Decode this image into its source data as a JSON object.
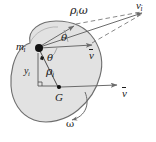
{
  "figure": {
    "kind": "rigid-body-velocity-diagram",
    "background_color": "#ffffff",
    "body_fill_color": "#e2e2e2",
    "body_stroke_color": "#6e6e6e",
    "line_color": "#6b6b6b",
    "text_color": "#1b1b1b",
    "point_color": "#111111",
    "labels": {
      "mass_element": "m",
      "mass_element_sub": "i",
      "center_of_mass": "G",
      "rho": "ρ",
      "rho_sub": "i",
      "rho_omega": "ρ",
      "rho_omega_sub": "i",
      "rho_omega_tail": "ω",
      "y_distance": "y",
      "y_distance_sub": "i",
      "velocity_i": "v",
      "velocity_i_sub": "i",
      "velocity_bar_upper": "v",
      "velocity_bar_lower": "v",
      "omega": "ω",
      "theta_upper": "θ",
      "theta_lower": "θ"
    },
    "points": {
      "mass_element": {
        "x": 38,
        "y": 48
      },
      "center_of_mass": {
        "x": 59,
        "y": 89
      },
      "velocity_i_tip": {
        "x": 143,
        "y": 12
      },
      "rho_omega_tip": {
        "x": 74,
        "y": 24
      },
      "v_bar_tip_at_mi": {
        "x": 92,
        "y": 44
      },
      "v_bar_tip_at_G": {
        "x": 117,
        "y": 86
      }
    },
    "vectors": [
      {
        "name": "rho-omega-vector",
        "from": "mass_element",
        "to": "rho_omega_tip",
        "style": "solid-arrow"
      },
      {
        "name": "v-bar-vector-at-mi",
        "from": "mass_element",
        "to": "v_bar_tip_at_mi",
        "style": "solid-arrow"
      },
      {
        "name": "vi-resultant-vector",
        "from": "mass_element",
        "to": "velocity_i_tip",
        "style": "solid-arrow"
      },
      {
        "name": "v-bar-vector-at-G",
        "from": "center_of_mass",
        "to": "v_bar_tip_at_G",
        "style": "solid-arrow"
      },
      {
        "name": "parallelogram-dashed-upper",
        "from": "rho_omega_tip",
        "to": "velocity_i_tip",
        "style": "dashed"
      },
      {
        "name": "parallelogram-dashed-lower",
        "from": "v_bar_tip_at_mi",
        "to": "velocity_i_tip",
        "style": "dashed"
      },
      {
        "name": "rho-line",
        "from": "center_of_mass",
        "to": "mass_element",
        "style": "solid"
      },
      {
        "name": "omega-rotation-arc",
        "style": "curved-arrow-counterclockwise"
      }
    ],
    "angle_marks": [
      {
        "name": "theta-upper-angle",
        "vertex": "mass_element",
        "label": "θ"
      },
      {
        "name": "theta-lower-angle",
        "vertex": "mass_element",
        "label": "θ"
      }
    ],
    "right_angle_marks": [
      {
        "name": "right-angle-at-mi"
      },
      {
        "name": "right-angle-at-G"
      }
    ]
  }
}
